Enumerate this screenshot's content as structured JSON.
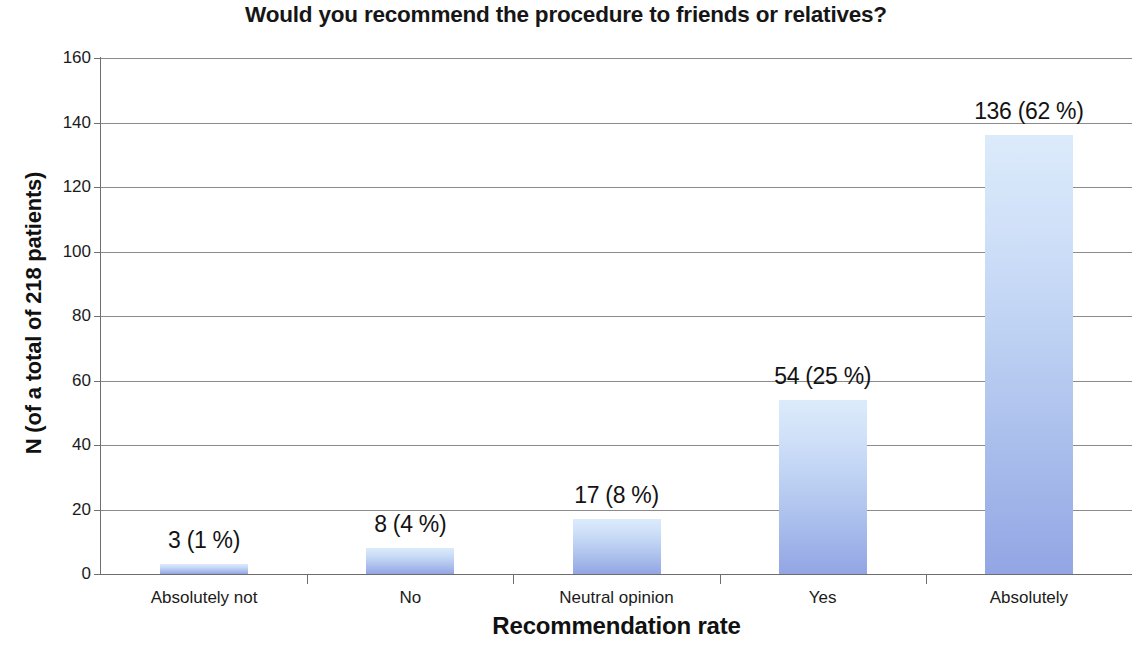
{
  "chart_data": {
    "type": "bar",
    "title": "Would you recommend the procedure to friends or relatives?",
    "xlabel": "Recommendation rate",
    "ylabel": "N (of a total of 218 patients)",
    "categories": [
      "Absolutely not",
      "No",
      "Neutral opinion",
      "Yes",
      "Absolutely"
    ],
    "values": [
      3,
      8,
      17,
      54,
      136
    ],
    "percentages": [
      "1 %",
      "4 %",
      "8 %",
      "25 %",
      "62 %"
    ],
    "data_labels": [
      "3 (1 %)",
      "8 (4 %)",
      "17 (8 %)",
      "54 (25 %)",
      "136 (62 %)"
    ],
    "ylim": [
      0,
      160
    ],
    "ytick_labels": [
      "160",
      "140",
      "120",
      "100",
      "80",
      "60",
      "40",
      "20",
      "0"
    ],
    "ytick_values": [
      160,
      140,
      120,
      100,
      80,
      60,
      40,
      20,
      0
    ],
    "grid": true,
    "legend": false,
    "total_n": 218,
    "bar_color_top": "#dcebfb",
    "bar_color_bottom": "#93a5e4",
    "axis_color": "#6f6f6f",
    "gridline_color": "#8b8b8b"
  }
}
